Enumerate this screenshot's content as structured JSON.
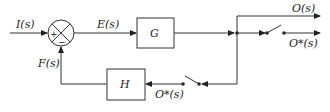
{
  "diagram": {
    "type": "block-diagram",
    "signals": {
      "input": "I(s)",
      "error": "E(s)",
      "feedback": "F(s)",
      "output": "O(s)",
      "sampled_output": "O*(s)",
      "sampled_feedback": "O*(s)"
    },
    "blocks": {
      "forward": "G",
      "feedback": "H"
    },
    "summing_junction": {
      "plus_sign": "+",
      "minus_sign": "−"
    }
  }
}
